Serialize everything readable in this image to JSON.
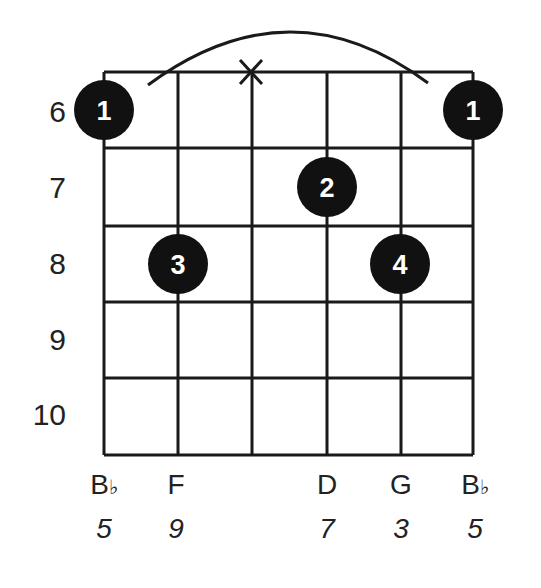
{
  "diagram": {
    "type": "guitar-chord-diagram",
    "grid": {
      "strings": 6,
      "string_x": [
        104,
        178,
        252,
        327,
        401,
        473
      ],
      "fret_y": [
        72,
        148,
        226,
        302,
        378,
        455
      ]
    },
    "fret_labels": [
      "6",
      "7",
      "8",
      "9",
      "10"
    ],
    "fret_label_y": [
      112,
      188,
      264,
      340,
      415
    ],
    "muted_marker": {
      "string_index": 2,
      "symbol": "X"
    },
    "barre_arc": {
      "from_string": 0,
      "to_string": 5,
      "fret": "6"
    },
    "fingers": [
      {
        "finger": "1",
        "string_index": 0,
        "fret_row": 0
      },
      {
        "finger": "1",
        "string_index": 5,
        "fret_row": 0
      },
      {
        "finger": "2",
        "string_index": 3,
        "fret_row": 1
      },
      {
        "finger": "3",
        "string_index": 1,
        "fret_row": 2
      },
      {
        "finger": "4",
        "string_index": 4,
        "fret_row": 2
      }
    ],
    "notes": [
      {
        "string_index": 0,
        "note": "B",
        "accidental": "♭",
        "interval": "5"
      },
      {
        "string_index": 1,
        "note": "F",
        "accidental": "",
        "interval": "9"
      },
      {
        "string_index": 3,
        "note": "D",
        "accidental": "",
        "interval": "7"
      },
      {
        "string_index": 4,
        "note": "G",
        "accidental": "",
        "interval": "3"
      },
      {
        "string_index": 5,
        "note": "B",
        "accidental": "♭",
        "interval": "5"
      }
    ],
    "colors": {
      "line": "#1a1a1a",
      "dot": "#111111",
      "dot_text": "#ffffff",
      "background": "#ffffff"
    }
  }
}
